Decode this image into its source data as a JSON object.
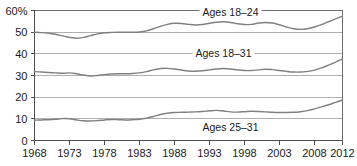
{
  "chart_data": {
    "type": "line",
    "title": "",
    "subtitle": "",
    "xlabel": "",
    "ylabel": "",
    "xlim": [
      1968,
      2012
    ],
    "ylim": [
      0,
      60
    ],
    "grid": true,
    "legend_position": "inline-labels",
    "y_ticks": [
      "0",
      "10",
      "20",
      "30",
      "40",
      "50",
      "60%"
    ],
    "y_tick_values": [
      0,
      10,
      20,
      30,
      40,
      50,
      60
    ],
    "x_ticks": [
      "1968",
      "1973",
      "1978",
      "1983",
      "1988",
      "1993",
      "1998",
      "2003",
      "2008",
      "2012"
    ],
    "x_tick_values": [
      1968,
      1973,
      1978,
      1983,
      1988,
      1993,
      1998,
      2003,
      2008,
      2012
    ],
    "x": [
      1968,
      1969,
      1970,
      1971,
      1972,
      1973,
      1974,
      1975,
      1976,
      1977,
      1978,
      1979,
      1980,
      1981,
      1982,
      1983,
      1984,
      1985,
      1986,
      1987,
      1988,
      1989,
      1990,
      1991,
      1992,
      1993,
      1994,
      1995,
      1996,
      1997,
      1998,
      1999,
      2000,
      2001,
      2002,
      2003,
      2004,
      2005,
      2006,
      2007,
      2008,
      2009,
      2010,
      2011,
      2012
    ],
    "series": [
      {
        "name": "Ages 18-24",
        "label": "Ages 18–24",
        "color": "#808080",
        "label_x": 1996,
        "label_y": 57.5,
        "values": [
          50.0,
          49.8,
          49.5,
          49.0,
          48.3,
          47.6,
          47.2,
          47.6,
          48.4,
          49.2,
          49.7,
          49.9,
          50.0,
          50.0,
          50.0,
          50.1,
          50.6,
          51.6,
          52.7,
          53.6,
          54.1,
          54.0,
          53.6,
          53.3,
          53.5,
          54.1,
          54.6,
          54.8,
          54.5,
          53.9,
          53.5,
          53.6,
          54.2,
          54.5,
          54.2,
          53.4,
          52.4,
          51.6,
          51.3,
          51.6,
          52.4,
          53.5,
          54.8,
          56.1,
          57.4
        ]
      },
      {
        "name": "Ages 18-31",
        "label": "Ages 18–31",
        "color": "#808080",
        "label_x": 1995,
        "label_y": 38.5,
        "values": [
          31.8,
          31.6,
          31.4,
          31.2,
          31.0,
          31.2,
          30.8,
          30.2,
          29.8,
          30.0,
          30.4,
          30.7,
          30.8,
          30.8,
          30.9,
          31.2,
          31.8,
          32.6,
          33.2,
          33.3,
          33.0,
          32.5,
          32.1,
          32.0,
          32.2,
          32.6,
          33.0,
          33.2,
          33.0,
          32.6,
          32.3,
          32.3,
          32.6,
          32.9,
          32.7,
          32.3,
          31.9,
          31.6,
          31.6,
          31.9,
          32.5,
          33.5,
          34.8,
          36.2,
          37.6
        ]
      },
      {
        "name": "Ages 25-31",
        "label": "Ages 25–31",
        "color": "#808080",
        "label_x": 1996,
        "label_y": 4.2,
        "values": [
          9.4,
          9.5,
          9.6,
          9.8,
          10.1,
          10.0,
          9.5,
          9.1,
          9.0,
          9.2,
          9.5,
          9.7,
          9.6,
          9.5,
          9.6,
          9.8,
          10.3,
          11.1,
          12.0,
          12.6,
          12.9,
          13.0,
          13.1,
          13.2,
          13.4,
          13.7,
          13.9,
          13.6,
          13.2,
          13.1,
          13.3,
          13.5,
          13.4,
          13.2,
          13.0,
          12.9,
          12.9,
          13.0,
          13.3,
          13.8,
          14.6,
          15.5,
          16.5,
          17.6,
          18.7
        ]
      }
    ]
  }
}
